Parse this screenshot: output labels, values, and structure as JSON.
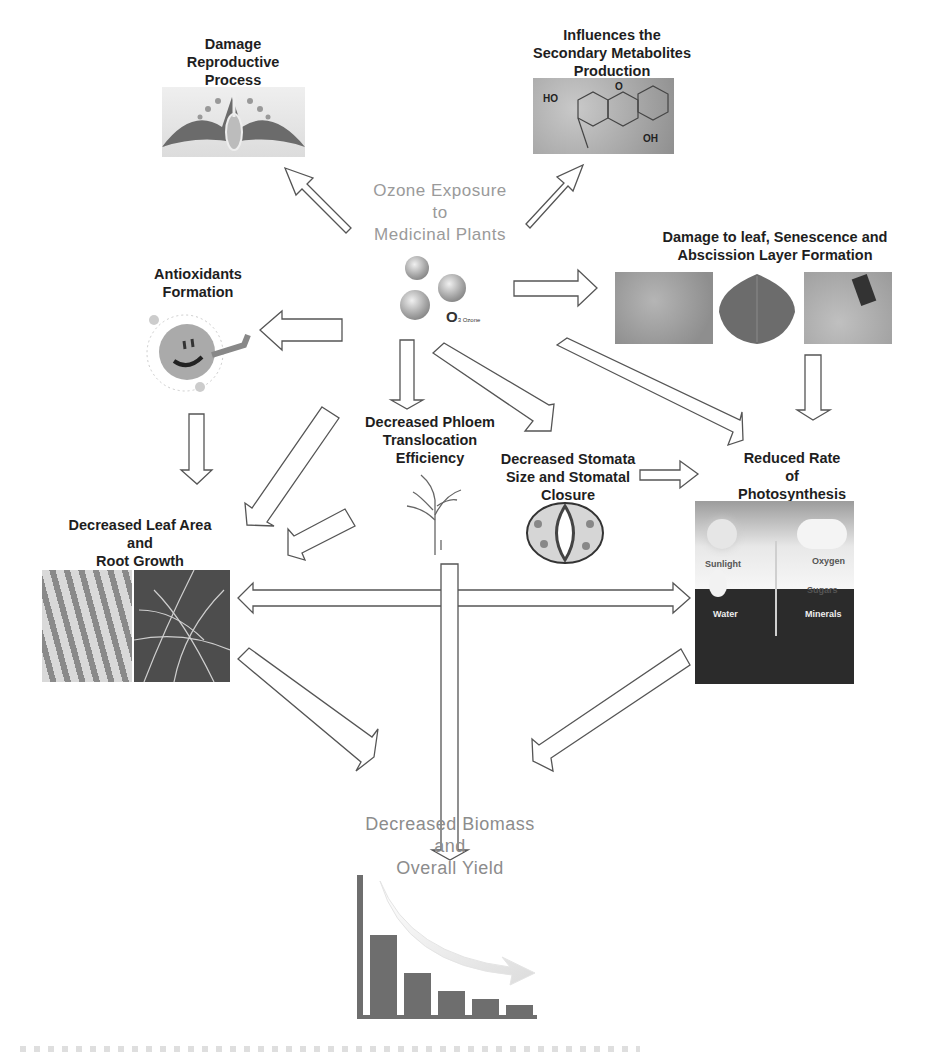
{
  "diagram": {
    "center": {
      "title": "Ozone Exposure\nto\nMedicinal Plants",
      "molecule_label": "O",
      "molecule_subscript": "3 Ozone"
    },
    "nodes": {
      "reproductive": "Damage\nReproductive\nProcess",
      "secondary_metabolites": "Influences the\nSecondary Metabolites\nProduction",
      "antioxidants": "Antioxidants\nFormation",
      "leaf_damage": "Damage to leaf, Senescence and\nAbscission Layer Formation",
      "phloem": "Decreased Phloem\nTranslocation\nEfficiency",
      "stomata": "Decreased Stomata\nSize and Stomatal\nClosure",
      "photosynthesis": "Reduced Rate\nof\nPhotosynthesis",
      "leaf_root": "Decreased Leaf Area\nand\nRoot Growth",
      "biomass": "Decreased Biomass\nand\nOverall Yield"
    },
    "photosynthesis_image_labels": {
      "sunlight": "Sunlight",
      "oxygen": "Oxygen",
      "sugars": "Sugars",
      "water": "Water",
      "minerals": "Minerals"
    },
    "molecule_labels": {
      "ho": "HO",
      "o": "O",
      "oh": "OH"
    },
    "edges": [
      {
        "from": "ozone",
        "to": "reproductive"
      },
      {
        "from": "ozone",
        "to": "secondary_metabolites"
      },
      {
        "from": "ozone",
        "to": "leaf_damage"
      },
      {
        "from": "ozone",
        "to": "antioxidants"
      },
      {
        "from": "ozone",
        "to": "phloem"
      },
      {
        "from": "ozone",
        "to": "stomata"
      },
      {
        "from": "ozone",
        "to": "photosynthesis"
      },
      {
        "from": "leaf_damage",
        "to": "photosynthesis"
      },
      {
        "from": "stomata",
        "to": "photosynthesis"
      },
      {
        "from": "antioxidants",
        "to": "leaf_root"
      },
      {
        "from": "ozone",
        "to": "leaf_root"
      },
      {
        "from": "phloem",
        "to": "leaf_root"
      },
      {
        "from": "leaf_root",
        "to": "photosynthesis",
        "bidirectional": true
      },
      {
        "from": "phloem",
        "to": "biomass"
      },
      {
        "from": "leaf_root",
        "to": "biomass"
      },
      {
        "from": "photosynthesis",
        "to": "biomass"
      }
    ],
    "colors": {
      "label_dark": "#1e1e1e",
      "label_grey": "#9a9a9a",
      "arrow_stroke": "#555555",
      "bar_fill": "#6e6e6e"
    }
  },
  "chart_data": {
    "type": "bar",
    "title": "",
    "categories": [
      "1",
      "2",
      "3",
      "4",
      "5"
    ],
    "values": [
      80,
      42,
      24,
      16,
      10
    ],
    "xlabel": "",
    "ylabel": "",
    "annotation": "decreasing trend arrow"
  }
}
